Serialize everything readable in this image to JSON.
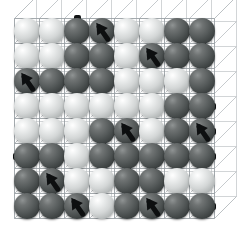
{
  "figure": {
    "type": "lattice-diagram",
    "grid": {
      "rows": 8,
      "cols": 8,
      "cell": 25,
      "origin_x": 27,
      "origin_y": 31
    },
    "depth": {
      "dx": 22,
      "dy": -22
    },
    "colors": {
      "light_site": "#d3d6d6",
      "dark_site": "#555a5a",
      "bond": "#111314",
      "frame_front": "#8a8f95",
      "frame_back": "#c3c8cc",
      "background": "#ffffff"
    },
    "legend": {
      "light_label": "vacant site",
      "dark_label": "occupied site",
      "bond_label": "bond",
      "arrow_label": "spin"
    },
    "site_states": [
      [
        "light",
        "light",
        "dark",
        "dark",
        "light",
        "light",
        "dark",
        "dark"
      ],
      [
        "light",
        "light",
        "dark",
        "dark",
        "light",
        "dark",
        "dark",
        "dark"
      ],
      [
        "dark",
        "dark",
        "dark",
        "dark",
        "light",
        "light",
        "light",
        "dark"
      ],
      [
        "light",
        "light",
        "light",
        "light",
        "light",
        "light",
        "dark",
        "dark"
      ],
      [
        "light",
        "light",
        "light",
        "dark",
        "dark",
        "light",
        "dark",
        "dark"
      ],
      [
        "dark",
        "dark",
        "light",
        "dark",
        "dark",
        "dark",
        "dark",
        "dark"
      ],
      [
        "dark",
        "dark",
        "light",
        "light",
        "dark",
        "dark",
        "light",
        "light"
      ],
      [
        "dark",
        "dark",
        "dark",
        "light",
        "dark",
        "dark",
        "dark",
        "dark"
      ]
    ],
    "h_bonds": [
      {
        "r": 0,
        "c": 6
      },
      {
        "r": 1,
        "c": 5
      },
      {
        "r": 1,
        "c": 6
      },
      {
        "r": 2,
        "c": 0
      },
      {
        "r": 2,
        "c": 1
      },
      {
        "r": 2,
        "c": 2
      },
      {
        "r": 3,
        "c": 6
      },
      {
        "r": 4,
        "c": 3
      },
      {
        "r": 5,
        "c": 0
      },
      {
        "r": 5,
        "c": 3
      },
      {
        "r": 5,
        "c": 5
      },
      {
        "r": 5,
        "c": 6
      },
      {
        "r": 7,
        "c": 0
      },
      {
        "r": 7,
        "c": 1
      },
      {
        "r": 7,
        "c": 5
      },
      {
        "r": 7,
        "c": 6
      }
    ],
    "v_bonds": [
      {
        "r": 0,
        "c": 2
      },
      {
        "r": 0,
        "c": 3
      },
      {
        "r": 0,
        "c": 6
      },
      {
        "r": 0,
        "c": 7
      },
      {
        "r": 1,
        "c": 2
      },
      {
        "r": 1,
        "c": 3
      },
      {
        "r": 1,
        "c": 7
      },
      {
        "r": 3,
        "c": 6
      },
      {
        "r": 3,
        "c": 7
      },
      {
        "r": 4,
        "c": 3
      },
      {
        "r": 4,
        "c": 6
      },
      {
        "r": 5,
        "c": 1
      },
      {
        "r": 5,
        "c": 4
      },
      {
        "r": 5,
        "c": 5
      },
      {
        "r": 6,
        "c": 0
      },
      {
        "r": 6,
        "c": 1
      },
      {
        "r": 6,
        "c": 4
      }
    ],
    "edge_bonds": [
      {
        "r": 0,
        "c": 2,
        "dir": "up"
      },
      {
        "r": 3,
        "c": 7,
        "dir": "right"
      },
      {
        "r": 4,
        "c": 7,
        "dir": "right"
      },
      {
        "r": 5,
        "c": 0,
        "dir": "left"
      },
      {
        "r": 5,
        "c": 7,
        "dir": "right"
      },
      {
        "r": 7,
        "c": 7,
        "dir": "right"
      }
    ],
    "arrows": [
      {
        "r": 0,
        "c": 3,
        "rot": -35
      },
      {
        "r": 1,
        "c": 5,
        "rot": -35
      },
      {
        "r": 2,
        "c": 0,
        "rot": -35
      },
      {
        "r": 4,
        "c": 4,
        "rot": -35
      },
      {
        "r": 4,
        "c": 7,
        "rot": -35
      },
      {
        "r": 6,
        "c": 1,
        "rot": -35
      },
      {
        "r": 7,
        "c": 2,
        "rot": -35
      },
      {
        "r": 7,
        "c": 5,
        "rot": -35
      }
    ]
  }
}
